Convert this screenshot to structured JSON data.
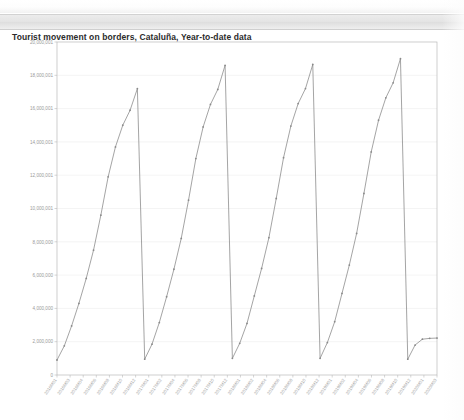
{
  "title_bar": {
    "title": "Tourist movement on borders, Cataluña, Year-to-date data"
  },
  "chart_data": {
    "type": "line",
    "title": "Tourist movement on borders, Cataluña, Year-to-date data",
    "xlabel": "",
    "ylabel": "",
    "grid": true,
    "legend": false,
    "ylim": [
      0,
      20000000
    ],
    "ytick_labels": [
      "20,000,001",
      "18,000,001",
      "16,000,001",
      "14,000,001",
      "12,000,001",
      "10,000,001",
      "8,000,000",
      "6,000,000",
      "4,000,000",
      "2,000,000",
      "0"
    ],
    "ytick_values": [
      20000000,
      18000000,
      16000000,
      14000000,
      12000000,
      10000000,
      8000000,
      6000000,
      4000000,
      2000000,
      0
    ],
    "categories": [
      "2016M01",
      "2016M02",
      "2016M03",
      "2016M04",
      "2016M05",
      "2016M06",
      "2016M07",
      "2016M08",
      "2016M09",
      "2016M10",
      "2016M11",
      "2016M12",
      "2017M01",
      "2017M02",
      "2017M03",
      "2017M04",
      "2017M05",
      "2017M06",
      "2017M07",
      "2017M08",
      "2017M09",
      "2017M10",
      "2017M11",
      "2017M12",
      "2018M01",
      "2018M02",
      "2018M03",
      "2018M04",
      "2018M05",
      "2018M06",
      "2018M07",
      "2018M08",
      "2018M09",
      "2018M10",
      "2018M11",
      "2018M12",
      "2019M01",
      "2019M02",
      "2019M03",
      "2019M04",
      "2019M05",
      "2019M06",
      "2019M07",
      "2019M08",
      "2019M09",
      "2019M10",
      "2019M11",
      "2019M12",
      "2020M01",
      "2020M02",
      "2020M03",
      "2020M04",
      "2020M05"
    ],
    "xtick_labels": [
      "2016M01",
      "2016M03",
      "2016M04",
      "2016M06",
      "2016M08",
      "2016M10",
      "2016M12",
      "2017M01",
      "2017M02",
      "2017M04",
      "2017M06",
      "2017M08",
      "2017M10",
      "2017M12",
      "2018M01",
      "2018M02",
      "2018M04",
      "2018M06",
      "2018M08",
      "2018M10",
      "2018M12",
      "2019M01",
      "2019M02",
      "2019M04",
      "2019M06",
      "2019M08",
      "2019M10",
      "2019M12",
      "2020M01",
      "2020M03"
    ],
    "series": [
      {
        "name": "Tourist movement on borders, Cataluña, Year-to-date data",
        "values": [
          900000,
          1750000,
          2950000,
          4300000,
          5800000,
          7500000,
          9600000,
          11900000,
          13700000,
          15000000,
          15900000,
          17200000,
          950000,
          1850000,
          3150000,
          4700000,
          6350000,
          8200000,
          10500000,
          13000000,
          14900000,
          16250000,
          17150000,
          18600000,
          1000000,
          1900000,
          3100000,
          4750000,
          6400000,
          8250000,
          10600000,
          13050000,
          14950000,
          16300000,
          17200000,
          18650000,
          1000000,
          1950000,
          3200000,
          4900000,
          6600000,
          8500000,
          10900000,
          13400000,
          15300000,
          16650000,
          17550000,
          19000000,
          950000,
          1800000,
          2150000,
          2200000,
          2220000
        ]
      }
    ]
  }
}
